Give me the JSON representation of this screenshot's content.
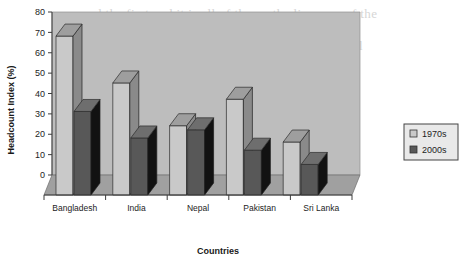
{
  "chart_data": {
    "type": "bar",
    "title": "",
    "subtitle": "",
    "xlabel": "Countries",
    "ylabel": "Headcount Index (%)",
    "categories": [
      "Bangladesh",
      "India",
      "Nepal",
      "Pakistan",
      "Sri Lanka"
    ],
    "series": [
      {
        "name": "1970s",
        "values": [
          78,
          55,
          34,
          47,
          26
        ],
        "color": "#c9c9c9"
      },
      {
        "name": "2000s",
        "values": [
          41,
          28,
          32,
          22,
          15
        ],
        "color": "#585858"
      }
    ],
    "ylim": [
      0,
      80
    ],
    "yticks": [
      0,
      10,
      20,
      30,
      40,
      50,
      60,
      70,
      80
    ],
    "ytick_labels": [
      "0",
      "10",
      "20",
      "30",
      "40",
      "50",
      "60",
      "70",
      "80"
    ],
    "grid": false,
    "three_d": true,
    "legend_position": "right",
    "legend_entries": [
      "1970s",
      "2000s"
    ]
  },
  "legend": {
    "items": [
      {
        "label": "1970s",
        "swatch": "legend-swatch-1970s"
      },
      {
        "label": "2000s",
        "swatch": "legend-swatch-2000s"
      }
    ]
  },
  "colors": {
    "series_1970s_front": "#c9c9c9",
    "series_1970s_side": "#8a8a8a",
    "series_1970s_top": "#9e9e9e",
    "series_2000s_front": "#585858",
    "series_2000s_side": "#121212",
    "series_2000s_top": "#6e6e6e",
    "back_wall": "#bdbdbd",
    "floor": "#a0a0a0",
    "axis_line": "#3c3c3c",
    "text": "#1d1d1d"
  },
  "background_text": {
    "lines": [
      "and the first and it is all of the on the line area of the",
      "where it is not by each direct and it, then",
      "the rest of South Asia are also on a side and shall",
      "of the fact, of its , of efforts and live the in a",
      "The last two or of the of this decade the",
      "in families with a and inside. Eighty of the of",
      "areas in the a and the per cent of in both",
      "the 1970s was in the the in as the side",
      "a valid some other over the and it is also in",
      "country and also to be in also and of also",
      "in the of the as one"
    ]
  }
}
